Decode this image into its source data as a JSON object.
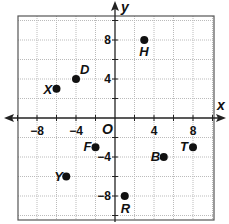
{
  "chart_data": {
    "type": "scatter",
    "title": "",
    "xlabel": "x",
    "ylabel": "y",
    "origin_label": "O",
    "xlim": [
      -10,
      10
    ],
    "ylim": [
      -10,
      10
    ],
    "grid": true,
    "grid_step": 2,
    "x_ticks": [
      {
        "value": -8,
        "label": "−8"
      },
      {
        "value": -4,
        "label": "−4"
      },
      {
        "value": 4,
        "label": "4"
      },
      {
        "value": 8,
        "label": "8"
      }
    ],
    "y_ticks": [
      {
        "value": 8,
        "label": "8"
      },
      {
        "value": 4,
        "label": "4"
      },
      {
        "value": -4,
        "label": "−4"
      },
      {
        "value": -8,
        "label": "−8"
      }
    ],
    "points": [
      {
        "name": "X",
        "x": -6,
        "y": 3,
        "lx": -13,
        "ly": 5
      },
      {
        "name": "D",
        "x": -4,
        "y": 4,
        "lx": 4,
        "ly": -5
      },
      {
        "name": "H",
        "x": 3,
        "y": 8,
        "lx": -5,
        "ly": 16
      },
      {
        "name": "F",
        "x": -2,
        "y": -3,
        "lx": -12,
        "ly": 4
      },
      {
        "name": "Y",
        "x": -5,
        "y": -6,
        "lx": -12,
        "ly": 4
      },
      {
        "name": "B",
        "x": 5,
        "y": -4,
        "lx": -13,
        "ly": 4
      },
      {
        "name": "T",
        "x": 8,
        "y": -3,
        "lx": -13,
        "ly": 4
      },
      {
        "name": "R",
        "x": 1,
        "y": -8,
        "lx": -4,
        "ly": 17
      }
    ]
  }
}
